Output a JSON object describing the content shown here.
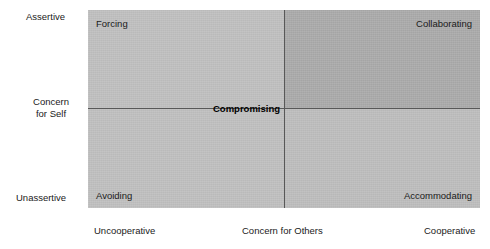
{
  "chart_data": {
    "type": "scatter",
    "title": "",
    "subtitle": "",
    "xlabel": "Concern for Others",
    "ylabel": "Concern for Self",
    "grid": false,
    "legend": null,
    "x_axis": {
      "label": "Concern for Others",
      "low_tick": "Uncooperative",
      "high_tick": "Cooperative",
      "range": [
        "Uncooperative",
        "Cooperative"
      ]
    },
    "y_axis": {
      "label_line1": "Concern",
      "label_line2": "for Self",
      "low_tick": "Unassertive",
      "high_tick": "Assertive",
      "range": [
        "Unassertive",
        "Assertive"
      ]
    },
    "quadrants": [
      {
        "key": "top_left",
        "label": "Forcing",
        "x": "Uncooperative",
        "y": "Assertive",
        "fill": "#bebebe"
      },
      {
        "key": "top_right",
        "label": "Collaborating",
        "x": "Cooperative",
        "y": "Assertive",
        "fill": "#a9a9a9"
      },
      {
        "key": "bottom_left",
        "label": "Avoiding",
        "x": "Uncooperative",
        "y": "Unassertive",
        "fill": "#bebebe"
      },
      {
        "key": "bottom_right",
        "label": "Accommodating",
        "x": "Cooperative",
        "y": "Unassertive",
        "fill": "#bcbcbc"
      }
    ],
    "center_point": {
      "label": "Compromising",
      "x": "middle",
      "y": "middle",
      "bold": true
    },
    "axis_line_color": "#585858",
    "background": "#ffffff"
  },
  "chart": {
    "quadrant_labels": {
      "forcing": "Forcing",
      "collaborating": "Collaborating",
      "avoiding": "Avoiding",
      "accommodating": "Accommodating"
    },
    "center": "Compromising",
    "y_axis": {
      "top": "Assertive",
      "bottom": "Unassertive",
      "title_line1": "Concern",
      "title_line2": "for Self"
    },
    "x_axis": {
      "left": "Uncooperative",
      "title": "Concern for Others",
      "right": "Cooperative"
    }
  }
}
